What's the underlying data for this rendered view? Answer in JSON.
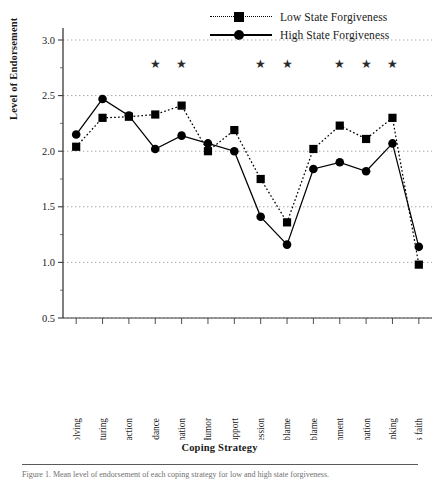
{
  "chart_data": {
    "type": "line",
    "title": "",
    "xlabel": "Coping Strategy",
    "ylabel": "Level of Endorsement",
    "ylim": [
      0.5,
      3.0
    ],
    "yticks": [
      "0.5",
      "1.0",
      "1.5",
      "2.0",
      "2.5",
      "3.0"
    ],
    "ytick_minor_step": 0.25,
    "grid": "horizontal-dotted",
    "legend_position": "top-right",
    "categories": [
      "Problem solving",
      "Cognitive restructuring",
      "Active distraction",
      "Cognitive avoidance",
      "Rumination",
      "Humor",
      "Social support",
      "Emotional expression",
      "Other-blame",
      "Self-blame",
      "Emotional containment",
      "Passive resignation",
      "Wishful thinking",
      "Religious faith"
    ],
    "series": [
      {
        "name": "Low State Forgiveness",
        "marker": "square",
        "line": "dotted",
        "color": "#000000",
        "values": [
          2.04,
          2.3,
          2.31,
          2.33,
          2.41,
          2.0,
          2.19,
          1.75,
          1.36,
          2.02,
          2.23,
          2.11,
          2.3,
          0.98
        ]
      },
      {
        "name": "High State Forgiveness",
        "marker": "circle",
        "line": "solid",
        "color": "#000000",
        "values": [
          2.15,
          2.47,
          2.32,
          2.02,
          2.14,
          2.07,
          2.0,
          1.41,
          1.16,
          1.84,
          1.9,
          1.82,
          2.07,
          1.14
        ]
      }
    ],
    "significance_marker": "★",
    "significance_level": 2.78,
    "significant_categories": [
      "Cognitive avoidance",
      "Rumination",
      "Emotional expression",
      "Other-blame",
      "Emotional containment",
      "Passive resignation",
      "Wishful thinking"
    ]
  },
  "legend": {
    "items": [
      {
        "label": "Low State Forgiveness",
        "marker": "square",
        "line": "dotted"
      },
      {
        "label": "High State Forgiveness",
        "marker": "circle",
        "line": "solid"
      }
    ]
  },
  "axes": {
    "x_title": "Coping Strategy",
    "y_title": "Level of Endorsement"
  },
  "caption": {
    "text": "Figure 1. Mean level of endorsement of each coping strategy for low and high state forgiveness."
  }
}
